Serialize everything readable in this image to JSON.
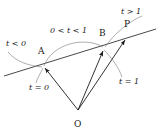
{
  "figure": {
    "type": "vector-parametrization-diagram",
    "background_color": "#ffffff",
    "stroke_color": "#1a1a1a",
    "arc_color": "#6e6e6e"
  },
  "points": [
    {
      "id": "A",
      "label": "A",
      "x": 43,
      "y": 66,
      "label_x": 38,
      "label_y": 47
    },
    {
      "id": "B",
      "label": "B",
      "x": 104,
      "y": 48,
      "label_x": 99,
      "label_y": 29
    },
    {
      "id": "P",
      "label": "P",
      "x": 126,
      "y": 37,
      "label_x": 124,
      "label_y": 20
    },
    {
      "id": "O",
      "label": "O",
      "x": 78,
      "y": 110,
      "label_x": 74,
      "label_y": 120
    }
  ],
  "annotations": [
    {
      "id": "t-lt-0",
      "text": "t < 0",
      "x": 6,
      "y": 40
    },
    {
      "id": "t-between",
      "text": "0 < t < 1",
      "x": 50,
      "y": 27
    },
    {
      "id": "t-gt-1",
      "text": "t > 1",
      "x": 121,
      "y": 8
    },
    {
      "id": "t-eq-0",
      "text": "t = 0",
      "x": 29,
      "y": 84
    },
    {
      "id": "t-eq-1",
      "text": "t = 1",
      "x": 119,
      "y": 78
    }
  ],
  "line": {
    "id": "line-AB-extended",
    "from_x": 4,
    "from_y": 76,
    "to_x": 156,
    "to_y": 29
  },
  "vectors": [
    {
      "id": "OA",
      "from": "O",
      "to": "A"
    },
    {
      "id": "OB",
      "from": "O",
      "to": "B"
    },
    {
      "id": "OP",
      "from": "O",
      "to": "P"
    }
  ],
  "arcs": [
    {
      "id": "arc-t-lt-0",
      "label_ref": "t-lt-0"
    },
    {
      "id": "arc-t-between",
      "label_ref": "t-between"
    },
    {
      "id": "arc-t-gt-1",
      "label_ref": "t-gt-1"
    },
    {
      "id": "arc-t-eq-0",
      "label_ref": "t-eq-0"
    },
    {
      "id": "arc-t-eq-1",
      "label_ref": "t-eq-1"
    }
  ]
}
